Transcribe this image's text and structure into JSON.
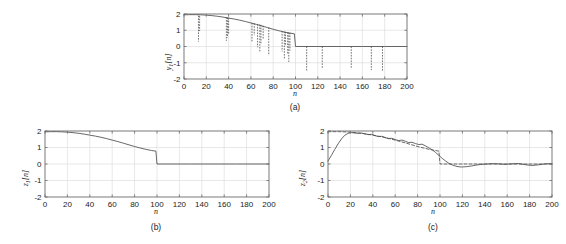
{
  "figure": {
    "background": "#ffffff",
    "line_color": "#4d4d4d",
    "axis_color": "#6b6b6b",
    "grid_color": "#d8d8d8"
  },
  "panels": [
    {
      "id": "a",
      "caption": "(a)",
      "xlabel": "n",
      "ylabel_main": "y",
      "ylabel_sub": "1",
      "ylabel_tail": "[n]",
      "xticks": [
        0,
        20,
        40,
        60,
        80,
        100,
        120,
        140,
        160,
        180,
        200
      ],
      "yticks": [
        2,
        1,
        0,
        -1,
        -2
      ],
      "xlim": [
        0,
        200
      ],
      "ylim": [
        -2,
        2
      ]
    },
    {
      "id": "b",
      "caption": "(b)",
      "xlabel": "n",
      "ylabel_main": "z",
      "ylabel_sub": "1",
      "ylabel_tail": "[n]",
      "xticks": [
        0,
        20,
        40,
        60,
        80,
        100,
        120,
        140,
        160,
        180,
        200
      ],
      "yticks": [
        2,
        1,
        0,
        -1,
        -2
      ],
      "xlim": [
        0,
        200
      ],
      "ylim": [
        -2,
        2
      ]
    },
    {
      "id": "c",
      "caption": "(c)",
      "xlabel": "n",
      "ylabel_main": "z",
      "ylabel_sub": "2",
      "ylabel_tail": "[n]",
      "xticks": [
        0,
        20,
        40,
        60,
        80,
        100,
        120,
        140,
        160,
        180,
        200
      ],
      "yticks": [
        2,
        1,
        0,
        -1,
        -2
      ],
      "xlim": [
        0,
        200
      ],
      "ylim": [
        -2,
        2
      ]
    }
  ],
  "chart_data": [
    {
      "type": "line",
      "panel": "a",
      "title": "(a)",
      "xlabel": "n",
      "ylabel": "y1[n]",
      "xlim": [
        0,
        200
      ],
      "ylim": [
        -2,
        2
      ],
      "grid": true,
      "xticks": [
        0,
        20,
        40,
        60,
        80,
        100,
        120,
        140,
        160,
        180,
        200
      ],
      "yticks": [
        -2,
        -1,
        0,
        1,
        2
      ],
      "series": [
        {
          "name": "y1[n] clean decaying signal",
          "style": "solid",
          "x": [
            0,
            5,
            10,
            15,
            20,
            25,
            30,
            35,
            40,
            45,
            50,
            55,
            60,
            65,
            70,
            75,
            80,
            85,
            90,
            95,
            99,
            100,
            105,
            120,
            140,
            160,
            180,
            200
          ],
          "y": [
            1.95,
            1.96,
            1.96,
            1.95,
            1.93,
            1.9,
            1.86,
            1.81,
            1.75,
            1.69,
            1.62,
            1.54,
            1.45,
            1.36,
            1.26,
            1.16,
            1.06,
            0.97,
            0.89,
            0.82,
            0.78,
            0.0,
            0.0,
            0.0,
            0.0,
            0.0,
            0.0,
            0.0
          ]
        },
        {
          "name": "impulsive noise spikes",
          "style": "dashed-vertical",
          "spikes": [
            {
              "x": 13,
              "from": 1.9,
              "to": 0.3
            },
            {
              "x": 14,
              "from": 1.88,
              "to": 0.95
            },
            {
              "x": 38,
              "from": 1.8,
              "to": 0.35
            },
            {
              "x": 39,
              "from": 1.78,
              "to": 0.55
            },
            {
              "x": 40,
              "from": 1.76,
              "to": 0.8
            },
            {
              "x": 61,
              "from": 1.45,
              "to": 0.25
            },
            {
              "x": 63,
              "from": 1.42,
              "to": 0.7
            },
            {
              "x": 66,
              "from": 1.38,
              "to": -0.05
            },
            {
              "x": 68,
              "from": 1.35,
              "to": -0.35
            },
            {
              "x": 69,
              "from": 1.33,
              "to": 0.2
            },
            {
              "x": 71,
              "from": 1.28,
              "to": 0.45
            },
            {
              "x": 76,
              "from": 1.18,
              "to": -0.55
            },
            {
              "x": 88,
              "from": 0.95,
              "to": -0.3
            },
            {
              "x": 90,
              "from": 0.92,
              "to": -0.8
            },
            {
              "x": 91,
              "from": 0.9,
              "to": 0.05
            },
            {
              "x": 93,
              "from": 0.88,
              "to": -0.5
            },
            {
              "x": 94,
              "from": 0.86,
              "to": -0.95
            },
            {
              "x": 95,
              "from": 0.85,
              "to": -0.25
            },
            {
              "x": 110,
              "from": 0.0,
              "to": -1.5
            },
            {
              "x": 124,
              "from": 0.0,
              "to": -1.35
            },
            {
              "x": 150,
              "from": 0.0,
              "to": -1.3
            },
            {
              "x": 168,
              "from": 0.0,
              "to": -1.45
            },
            {
              "x": 178,
              "from": 0.0,
              "to": -1.5
            }
          ]
        }
      ]
    },
    {
      "type": "line",
      "panel": "b",
      "title": "(b)",
      "xlabel": "n",
      "ylabel": "z1[n]",
      "xlim": [
        0,
        200
      ],
      "ylim": [
        -2,
        2
      ],
      "grid": true,
      "xticks": [
        0,
        20,
        40,
        60,
        80,
        100,
        120,
        140,
        160,
        180,
        200
      ],
      "yticks": [
        -2,
        -1,
        0,
        1,
        2
      ],
      "series": [
        {
          "name": "z1[n] median-filtered output",
          "style": "solid",
          "x": [
            0,
            5,
            10,
            15,
            20,
            25,
            30,
            35,
            40,
            45,
            50,
            55,
            60,
            65,
            70,
            75,
            80,
            85,
            90,
            95,
            99,
            100,
            110,
            130,
            150,
            170,
            200
          ],
          "y": [
            1.95,
            1.96,
            1.96,
            1.95,
            1.93,
            1.9,
            1.86,
            1.81,
            1.75,
            1.69,
            1.62,
            1.54,
            1.45,
            1.36,
            1.26,
            1.16,
            1.06,
            0.97,
            0.89,
            0.82,
            0.78,
            0.0,
            0.0,
            0.0,
            0.0,
            0.0,
            0.0
          ]
        }
      ]
    },
    {
      "type": "line",
      "panel": "c",
      "title": "(c)",
      "xlabel": "n",
      "ylabel": "z2[n]",
      "xlim": [
        0,
        200
      ],
      "ylim": [
        -2,
        2
      ],
      "grid": true,
      "xticks": [
        0,
        20,
        40,
        60,
        80,
        100,
        120,
        140,
        160,
        180,
        200
      ],
      "yticks": [
        -2,
        -1,
        0,
        1,
        2
      ],
      "series": [
        {
          "name": "z2[n] linear lowpass filtered output",
          "style": "solid",
          "x": [
            0,
            3,
            6,
            9,
            12,
            15,
            18,
            21,
            24,
            27,
            30,
            33,
            36,
            39,
            42,
            45,
            48,
            51,
            54,
            57,
            60,
            63,
            66,
            69,
            72,
            75,
            78,
            81,
            84,
            87,
            90,
            93,
            96,
            99,
            102,
            105,
            108,
            111,
            114,
            117,
            120,
            124,
            128,
            132,
            136,
            140,
            146,
            152,
            158,
            164,
            170,
            176,
            182,
            188,
            194,
            200
          ],
          "y": [
            0.18,
            0.52,
            0.88,
            1.22,
            1.52,
            1.74,
            1.86,
            1.9,
            1.88,
            1.86,
            1.87,
            1.83,
            1.78,
            1.8,
            1.72,
            1.66,
            1.68,
            1.6,
            1.54,
            1.56,
            1.48,
            1.42,
            1.45,
            1.38,
            1.3,
            1.32,
            1.24,
            1.18,
            1.2,
            1.1,
            0.98,
            0.86,
            0.7,
            0.52,
            0.34,
            0.18,
            0.04,
            -0.06,
            -0.13,
            -0.17,
            -0.18,
            -0.16,
            -0.12,
            -0.07,
            -0.03,
            -0.01,
            0.02,
            0.01,
            -0.02,
            0.01,
            0.03,
            -0.04,
            -0.09,
            -0.05,
            0.01,
            0.02
          ]
        },
        {
          "name": "reference ideal signal",
          "style": "dashed",
          "x": [
            0,
            2,
            10,
            20,
            30,
            40,
            50,
            60,
            70,
            80,
            90,
            99,
            100,
            120,
            140,
            160,
            180,
            200
          ],
          "y": [
            1.95,
            1.96,
            1.96,
            1.93,
            1.86,
            1.75,
            1.62,
            1.45,
            1.26,
            1.06,
            0.89,
            0.78,
            0.0,
            0.0,
            0.0,
            0.0,
            0.0,
            0.0
          ]
        }
      ]
    }
  ]
}
